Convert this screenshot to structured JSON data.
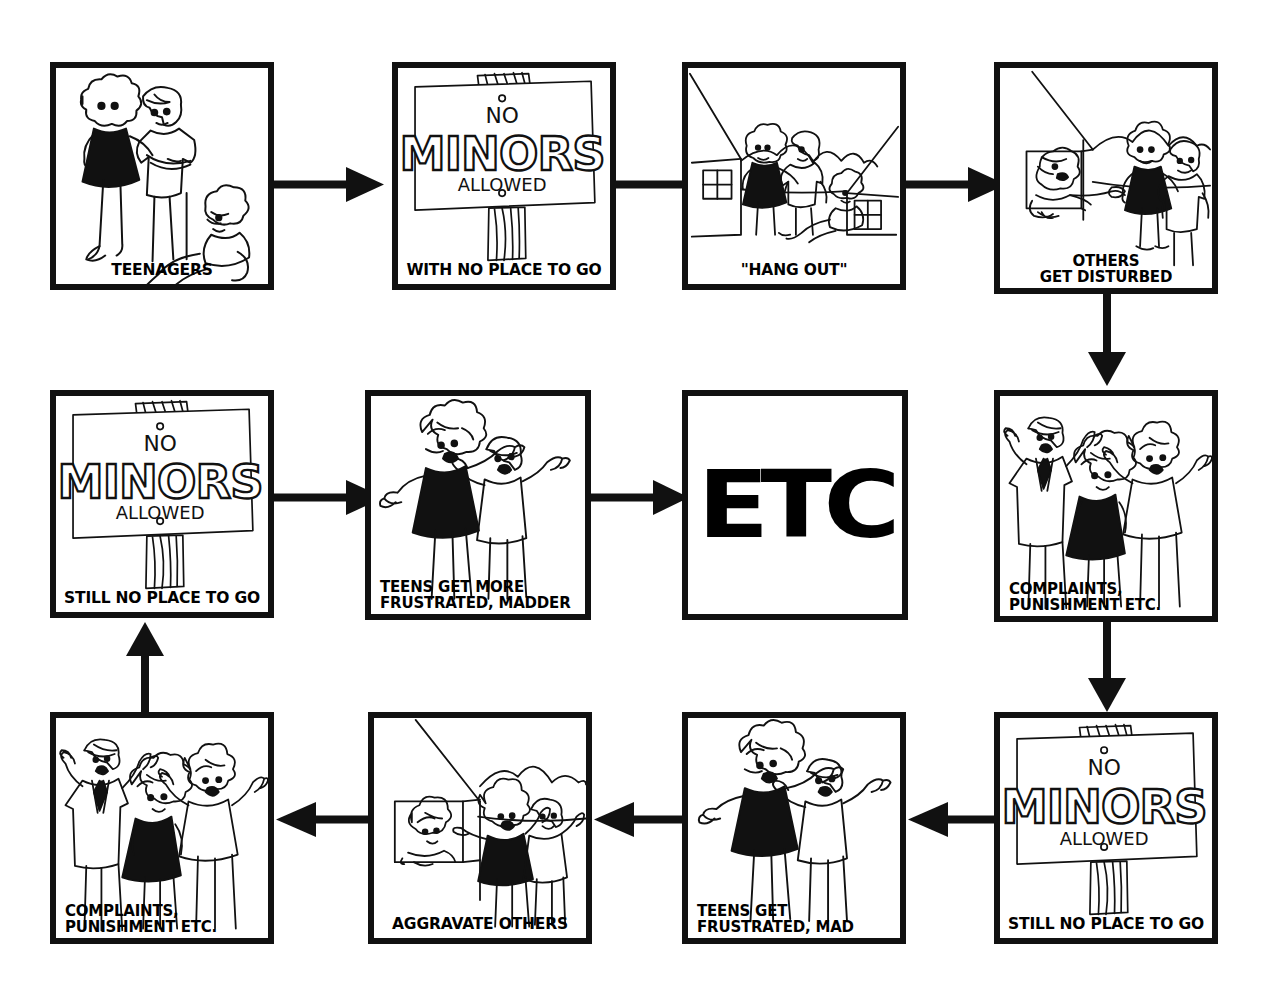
{
  "figure": {
    "background_color": "#ffffff",
    "ink_color": "#111111",
    "grid": {
      "columns": 4,
      "rows": 3,
      "flow": "snaking left-to-right, down, right-to-left, down, left-to-right"
    }
  },
  "panels": [
    {
      "id": "p1",
      "row": 1,
      "column": 1,
      "caption": "TEENAGERS",
      "caption_lines": [
        "TEENAGERS"
      ],
      "art": "three-teenagers",
      "art_description": "Three teenagers standing and sitting, one girl in a black dress, one boy with arms crossed, one seated boy"
    },
    {
      "id": "p2",
      "row": 1,
      "column": 2,
      "caption": "WITH NO PLACE TO GO",
      "caption_lines": [
        "WITH NO PLACE TO GO"
      ],
      "art": "no-minors-sign",
      "sign_text": {
        "line1": "NO",
        "line2": "MINORS",
        "line3": "ALLOWED"
      },
      "art_description": "Hand-lettered wooden sign on a post reading NO MINORS ALLOWED"
    },
    {
      "id": "p3",
      "row": 1,
      "column": 3,
      "caption": "\"HANG OUT\"",
      "caption_lines": [
        "\"HANG OUT\""
      ],
      "art": "teens-between-houses",
      "art_description": "Teens loitering between two houses with windows, hills behind"
    },
    {
      "id": "p4",
      "row": 1,
      "column": 4,
      "caption": "OTHERS\nGET DISTURBED",
      "caption_lines": [
        "OTHERS",
        "GET DISTURBED"
      ],
      "art": "neighbour-at-window",
      "art_description": "Neighbour leaning out of a window shouting and pointing at two teens"
    },
    {
      "id": "p5",
      "row": 2,
      "column": 4,
      "caption": "COMPLAINTS,\nPUNISHMENT ETC.",
      "caption_lines": [
        "COMPLAINTS,",
        "PUNISHMENT ETC."
      ],
      "art": "three-angry-adults",
      "art_description": "Three shouting adults with arms raised, man in tie, girl in black dress, woman"
    },
    {
      "id": "p6",
      "row": 3,
      "column": 4,
      "caption": "STILL NO PLACE TO GO",
      "caption_lines": [
        "STILL NO PLACE TO GO"
      ],
      "art": "no-minors-sign",
      "sign_text": {
        "line1": "NO",
        "line2": "MINORS",
        "line3": "ALLOWED"
      },
      "art_description": "Same NO MINORS ALLOWED sign"
    },
    {
      "id": "p7",
      "row": 3,
      "column": 3,
      "caption": "TEENS GET\nFRUSTRATED, MAD",
      "caption_lines": [
        "TEENS GET",
        "FRUSTRATED, MAD"
      ],
      "art": "two-frustrated-teens",
      "art_description": "Two teens with arms thrown up, mouths open, girl in black dress"
    },
    {
      "id": "p8",
      "row": 3,
      "column": 2,
      "caption": "AGGRAVATE OTHERS",
      "caption_lines": [
        "AGGRAVATE OTHERS"
      ],
      "art": "teens-aggravate-neighbour",
      "art_description": "Teens yelling by a house while a neighbour watches from the window"
    },
    {
      "id": "p9",
      "row": 3,
      "column": 1,
      "caption": "COMPLAINTS,\nPUNISHMENT ETC.",
      "caption_lines": [
        "COMPLAINTS,",
        "PUNISHMENT ETC."
      ],
      "art": "three-angry-adults",
      "art_description": "Three shouting adults with arms raised"
    },
    {
      "id": "p10",
      "row": 2,
      "column": 1,
      "caption": "STILL NO PLACE TO GO",
      "caption_lines": [
        "STILL NO PLACE TO GO"
      ],
      "art": "no-minors-sign",
      "sign_text": {
        "line1": "NO",
        "line2": "MINORS",
        "line3": "ALLOWED"
      },
      "art_description": "Same NO MINORS ALLOWED sign"
    },
    {
      "id": "p11",
      "row": 2,
      "column": 2,
      "caption": "TEENS GET MORE\nFRUSTRATED, MADDER",
      "caption_lines": [
        "TEENS GET MORE",
        "FRUSTRATED, MADDER"
      ],
      "art": "two-frustrated-teens",
      "art_description": "Two teens with arms raised, angrier"
    },
    {
      "id": "p12",
      "row": 2,
      "column": 3,
      "caption": "",
      "caption_lines": [],
      "art": "etc-text",
      "etc_label": "ETC",
      "art_description": "Very heavy bold condensed letters reading ETC"
    }
  ],
  "arrows": [
    {
      "id": "a1",
      "from": "p1",
      "to": "p2",
      "direction": "right"
    },
    {
      "id": "a2",
      "from": "p2",
      "to": "p3",
      "direction": "right"
    },
    {
      "id": "a3",
      "from": "p3",
      "to": "p4",
      "direction": "right"
    },
    {
      "id": "a4",
      "from": "p4",
      "to": "p5",
      "direction": "down"
    },
    {
      "id": "a5",
      "from": "p5",
      "to": "p6",
      "direction": "down"
    },
    {
      "id": "a6",
      "from": "p6",
      "to": "p7",
      "direction": "left"
    },
    {
      "id": "a7",
      "from": "p7",
      "to": "p8",
      "direction": "left"
    },
    {
      "id": "a8",
      "from": "p8",
      "to": "p9",
      "direction": "left"
    },
    {
      "id": "a9",
      "from": "p9",
      "to": "p10",
      "direction": "up"
    },
    {
      "id": "a10",
      "from": "p10",
      "to": "p11",
      "direction": "right"
    },
    {
      "id": "a11",
      "from": "p11",
      "to": "p12",
      "direction": "right"
    }
  ]
}
